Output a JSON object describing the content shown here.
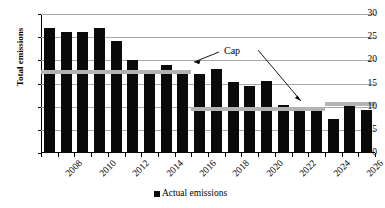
{
  "chart_data": {
    "type": "bar",
    "title": "",
    "xlabel": "",
    "ylabel": "Total emissions",
    "ylim": [
      0,
      30
    ],
    "ytick_values": [
      0,
      5,
      10,
      15,
      20,
      25,
      30
    ],
    "ytick_labels": [
      "0",
      "5",
      "10",
      "15",
      "20",
      "25",
      "30"
    ],
    "grid": "horizontal",
    "legend_position": "bottom-center",
    "legend": [
      "Actual emissions"
    ],
    "categories": [
      "2008",
      "2009",
      "2010",
      "2011",
      "2012",
      "2013",
      "2014",
      "2015",
      "2016",
      "2017",
      "2018",
      "2019",
      "2020",
      "2021",
      "2022",
      "2023",
      "2024",
      "2025",
      "2026",
      "2027"
    ],
    "xtick_labels_shown": [
      "2008",
      "2010",
      "2012",
      "2014",
      "2016",
      "2018",
      "2020",
      "2022",
      "2024",
      "2026"
    ],
    "series": [
      {
        "name": "Actual emissions",
        "color": "#0a0a0a",
        "values": [
          26.9,
          26.1,
          26.1,
          27.0,
          24.2,
          20.1,
          17.4,
          19.0,
          17.4,
          17.1,
          18.2,
          15.4,
          14.5,
          15.5,
          10.3,
          9.4,
          9.3,
          7.4,
          10.5,
          9.3
        ]
      }
    ],
    "cap_line": {
      "name": "Cap",
      "color": "#b3b3b3",
      "label": "Cap",
      "segments": [
        {
          "start_category": "2008",
          "end_category": "2016",
          "value": 17.5
        },
        {
          "start_category": "2017",
          "end_category": "2024",
          "value": 9.5
        },
        {
          "start_category": "2025",
          "end_category": "2027",
          "value": 10.5
        }
      ]
    },
    "annotations": [
      {
        "text": "Cap",
        "x_px": 224,
        "y_px": 45,
        "arrows": 2
      }
    ]
  },
  "legend": {
    "swatch_name": "actual-emissions-swatch",
    "label": "Actual emissions"
  },
  "axes": {
    "y_title": "Total emissions"
  }
}
